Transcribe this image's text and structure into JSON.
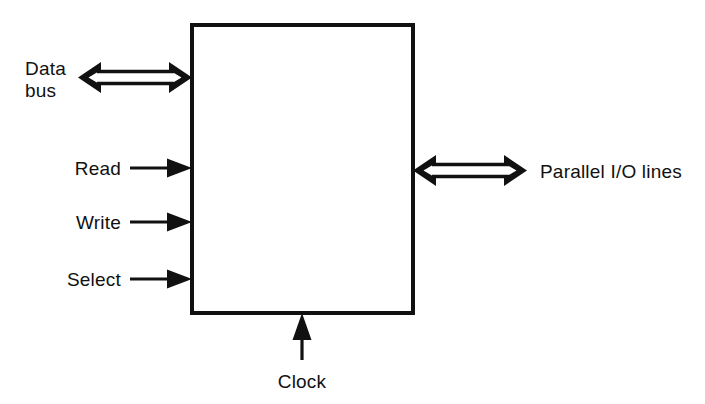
{
  "diagram": {
    "background_color": "#ffffff",
    "line_color": "#111111",
    "block": {
      "name": "interface-block",
      "label": "",
      "x": 192,
      "y": 25,
      "width": 221,
      "height": 288,
      "border_width": 4
    },
    "signals": [
      {
        "id": "data-bus",
        "label_lines": [
          "Data",
          "bus"
        ],
        "label_text": "Data bus",
        "direction": "bidirectional",
        "side": "left",
        "arrow_style": "hollow-block",
        "x_start": 78,
        "x_end": 192,
        "y": 77
      },
      {
        "id": "read",
        "label_lines": [
          "Read"
        ],
        "label_text": "Read",
        "direction": "input",
        "side": "left",
        "arrow_style": "thin-solid",
        "x_start": 130,
        "x_end": 192,
        "y": 168
      },
      {
        "id": "write",
        "label_lines": [
          "Write"
        ],
        "label_text": "Write",
        "direction": "input",
        "side": "left",
        "arrow_style": "thin-solid",
        "x_start": 130,
        "x_end": 192,
        "y": 222
      },
      {
        "id": "select",
        "label_lines": [
          "Select"
        ],
        "label_text": "Select",
        "direction": "input",
        "side": "left",
        "arrow_style": "thin-solid",
        "x_start": 130,
        "x_end": 192,
        "y": 279
      },
      {
        "id": "parallel-io-lines",
        "label_lines": [
          "Parallel I/O lines"
        ],
        "label_text": "Parallel I/O lines",
        "direction": "bidirectional",
        "side": "right",
        "arrow_style": "hollow-block",
        "x_start": 413,
        "x_end": 527,
        "y": 170
      },
      {
        "id": "clock",
        "label_lines": [
          "Clock"
        ],
        "label_text": "Clock",
        "direction": "input",
        "side": "bottom",
        "arrow_style": "thin-solid",
        "x": 302,
        "y_start": 360,
        "y_end": 313
      }
    ],
    "labels": {
      "data_bus_line1": "Data",
      "data_bus_line2": "bus",
      "read": "Read",
      "write": "Write",
      "select": "Select",
      "parallel_io": "Parallel I/O lines",
      "clock": "Clock"
    }
  }
}
